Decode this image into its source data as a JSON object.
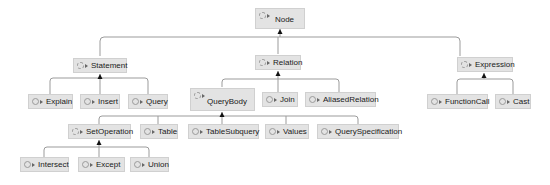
{
  "diagram": {
    "colors": {
      "node_bg": "#e3e3e3",
      "node_border": "#d0d0d0",
      "edge": "#9b9b9b",
      "arrowhead": "#111111",
      "text": "#1a1a1a"
    },
    "nodes": {
      "node": {
        "label": "Node",
        "kind": "abstract-class"
      },
      "statement": {
        "label": "Statement",
        "kind": "abstract-class"
      },
      "relation": {
        "label": "Relation",
        "kind": "abstract-class"
      },
      "expression": {
        "label": "Expression",
        "kind": "abstract-class"
      },
      "explain": {
        "label": "Explain",
        "kind": "class"
      },
      "insert": {
        "label": "Insert",
        "kind": "class"
      },
      "query": {
        "label": "Query",
        "kind": "class"
      },
      "querybody": {
        "label": "QueryBody",
        "kind": "abstract-class"
      },
      "join": {
        "label": "Join",
        "kind": "class"
      },
      "aliasedrelation": {
        "label": "AliasedRelation",
        "kind": "class"
      },
      "functioncall": {
        "label": "FunctionCall",
        "kind": "class"
      },
      "cast": {
        "label": "Cast",
        "kind": "class"
      },
      "setoperation": {
        "label": "SetOperation",
        "kind": "abstract-class"
      },
      "table": {
        "label": "Table",
        "kind": "class"
      },
      "tablesubquery": {
        "label": "TableSubquery",
        "kind": "class"
      },
      "values": {
        "label": "Values",
        "kind": "class"
      },
      "queryspecification": {
        "label": "QuerySpecification",
        "kind": "class"
      },
      "intersect": {
        "label": "Intersect",
        "kind": "class"
      },
      "except": {
        "label": "Except",
        "kind": "class"
      },
      "union": {
        "label": "Union",
        "kind": "class"
      }
    },
    "edges": [
      [
        "statement",
        "node"
      ],
      [
        "relation",
        "node"
      ],
      [
        "expression",
        "node"
      ],
      [
        "explain",
        "statement"
      ],
      [
        "insert",
        "statement"
      ],
      [
        "query",
        "statement"
      ],
      [
        "querybody",
        "relation"
      ],
      [
        "join",
        "relation"
      ],
      [
        "aliasedrelation",
        "relation"
      ],
      [
        "functioncall",
        "expression"
      ],
      [
        "cast",
        "expression"
      ],
      [
        "setoperation",
        "querybody"
      ],
      [
        "table",
        "querybody"
      ],
      [
        "tablesubquery",
        "querybody"
      ],
      [
        "values",
        "querybody"
      ],
      [
        "queryspecification",
        "querybody"
      ],
      [
        "intersect",
        "setoperation"
      ],
      [
        "except",
        "setoperation"
      ],
      [
        "union",
        "setoperation"
      ]
    ],
    "icons": {
      "class": "class-icon",
      "visibility": "visibility-arrow-icon"
    }
  }
}
